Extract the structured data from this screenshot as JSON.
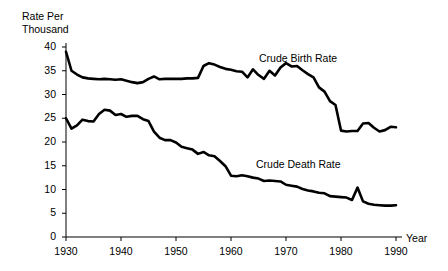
{
  "chart_data": {
    "type": "line",
    "title": "",
    "xlabel": "Year",
    "ylabel": "Rate Per\nThousand",
    "ylabel_line1": "Rate Per",
    "ylabel_line2": "Thousand",
    "xlim": [
      1930,
      1990
    ],
    "ylim": [
      0,
      40
    ],
    "grid": false,
    "legend_position": "inline-annotation",
    "xticks": [
      1930,
      1940,
      1950,
      1960,
      1970,
      1980,
      1990
    ],
    "xtick_labels": [
      "1930",
      "1940",
      "1950",
      "1960",
      "1970",
      "1980",
      "1990"
    ],
    "yticks": [
      0,
      5,
      10,
      15,
      20,
      25,
      30,
      35,
      40
    ],
    "ytick_labels": [
      "0",
      "5",
      "10",
      "15",
      "20",
      "25",
      "30",
      "35",
      "40"
    ],
    "annotations": [
      {
        "text": "Crude Birth Rate",
        "x": 1965,
        "y": 36.5
      },
      {
        "text": "Crude Death Rate",
        "x": 1964,
        "y": 13.5
      }
    ],
    "x": [
      1930,
      1931,
      1932,
      1933,
      1934,
      1935,
      1936,
      1937,
      1938,
      1939,
      1940,
      1941,
      1942,
      1943,
      1944,
      1945,
      1946,
      1947,
      1948,
      1949,
      1950,
      1951,
      1952,
      1953,
      1954,
      1955,
      1956,
      1957,
      1958,
      1959,
      1960,
      1961,
      1962,
      1963,
      1964,
      1965,
      1966,
      1967,
      1968,
      1969,
      1970,
      1971,
      1972,
      1973,
      1974,
      1975,
      1976,
      1977,
      1978,
      1979,
      1980,
      1981,
      1982,
      1983,
      1984,
      1985,
      1986,
      1987,
      1988,
      1989,
      1990
    ],
    "series": [
      {
        "name": "Crude Birth Rate",
        "color": "#000000",
        "values": [
          39.0,
          35.0,
          34.2,
          33.6,
          33.4,
          33.3,
          33.2,
          33.3,
          33.2,
          33.1,
          33.2,
          32.9,
          32.6,
          32.4,
          32.6,
          33.3,
          33.8,
          33.2,
          33.3,
          33.3,
          33.3,
          33.3,
          33.4,
          33.4,
          33.5,
          36.0,
          36.6,
          36.3,
          35.8,
          35.4,
          35.2,
          34.9,
          34.8,
          33.6,
          35.3,
          34.1,
          33.3,
          35.0,
          34.0,
          35.7,
          36.6,
          35.9,
          36.0,
          35.1,
          34.3,
          33.6,
          31.5,
          30.6,
          28.6,
          27.8,
          22.4,
          22.2,
          22.3,
          22.3,
          23.9,
          24.0,
          23.0,
          22.2,
          22.5,
          23.2,
          23.1
        ]
      },
      {
        "name": "Crude Death Rate",
        "color": "#000000",
        "values": [
          25.0,
          22.8,
          23.5,
          24.7,
          24.4,
          24.3,
          25.9,
          26.8,
          26.6,
          25.7,
          25.9,
          25.3,
          25.5,
          25.5,
          24.8,
          24.4,
          22.2,
          20.9,
          20.4,
          20.4,
          19.9,
          19.0,
          18.7,
          18.4,
          17.5,
          17.9,
          17.2,
          17.0,
          16.0,
          14.9,
          12.9,
          12.8,
          13.0,
          12.8,
          12.5,
          12.3,
          11.8,
          11.9,
          11.8,
          11.7,
          11.0,
          10.8,
          10.6,
          10.1,
          9.8,
          9.6,
          9.3,
          9.2,
          8.6,
          8.5,
          8.4,
          8.3,
          7.8,
          10.4,
          7.5,
          7.0,
          6.8,
          6.7,
          6.6,
          6.6,
          6.7
        ]
      }
    ]
  }
}
